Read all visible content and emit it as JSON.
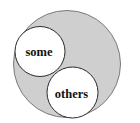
{
  "diagram": {
    "type": "nested-circles",
    "colors": {
      "background": "#ffffff",
      "outer_fill": "#cfcfcf",
      "outer_stroke": "#7a7a7a",
      "inner_fill": "#ffffff",
      "inner_stroke": "#2a2a2a",
      "text": "#111111"
    },
    "outer_circle": {
      "label": ""
    },
    "inner_circles": [
      {
        "label": "some"
      },
      {
        "label": "others"
      }
    ]
  }
}
